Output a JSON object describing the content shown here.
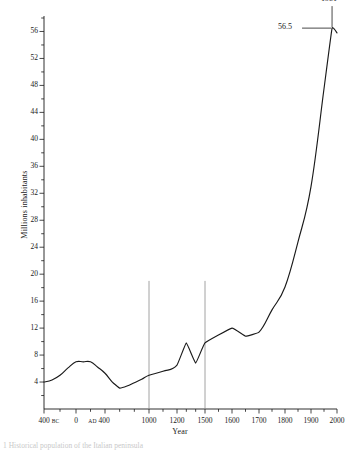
{
  "figure": {
    "caption": "1 Historical population of the Italian peninsula"
  },
  "chart_data": {
    "type": "line",
    "title": "",
    "xlabel": "Year",
    "ylabel": "Millions inhabitants",
    "grid": false,
    "legend": false,
    "ylim": [
      0,
      58
    ],
    "yticks": [
      4,
      8,
      12,
      16,
      20,
      24,
      28,
      32,
      36,
      40,
      44,
      48,
      52,
      56
    ],
    "yminor_step": 2,
    "xtick_labels": [
      "400",
      "0",
      "400",
      "1000",
      "1200",
      "1500",
      "1600",
      "1700",
      "1800",
      "1900",
      "2000"
    ],
    "xtick_eras": [
      "BC",
      "",
      "AD",
      "",
      "",
      "",
      "",
      "",
      "",
      "",
      ""
    ],
    "xticks": [
      -400,
      0,
      400,
      1000,
      1200,
      1500,
      1600,
      1700,
      1800,
      1900,
      2000
    ],
    "x_minor_ticks": [
      -200,
      200,
      600,
      800,
      1100,
      1300,
      1400,
      1550,
      1650,
      1750,
      1850,
      1950
    ],
    "x": [
      -400,
      -300,
      -200,
      -100,
      0,
      100,
      200,
      300,
      400,
      500,
      600,
      700,
      800,
      900,
      1000,
      1100,
      1200,
      1300,
      1400,
      1500,
      1600,
      1650,
      1700,
      1750,
      1800,
      1850,
      1900,
      1950,
      1981,
      2000
    ],
    "y": [
      4.0,
      4.3,
      5.0,
      6.1,
      7.0,
      7.0,
      7.0,
      6.2,
      5.3,
      4.0,
      3.1,
      3.4,
      3.9,
      4.4,
      5.0,
      5.6,
      6.5,
      9.8,
      6.8,
      9.8,
      12.0,
      10.8,
      11.4,
      14.7,
      18.1,
      24.8,
      33.0,
      47.5,
      56.5,
      55.8
    ],
    "series": [
      {
        "name": "Population",
        "color": "#1a1a1a",
        "values": [
          4.0,
          4.3,
          5.0,
          6.1,
          7.0,
          7.0,
          7.0,
          6.2,
          5.3,
          4.0,
          3.1,
          3.4,
          3.9,
          4.4,
          5.0,
          5.6,
          6.5,
          9.8,
          6.8,
          9.8,
          12.0,
          10.8,
          11.4,
          14.7,
          18.1,
          24.8,
          33.0,
          47.5,
          56.5,
          55.8
        ]
      }
    ],
    "reference_lines": [
      {
        "x": 1000,
        "y_top": 19,
        "color": "#8a8a8a"
      },
      {
        "x": 1500,
        "y_top": 19,
        "color": "#8a8a8a"
      }
    ],
    "annotations": [
      {
        "name": "peak-year",
        "text": "1981",
        "x": 1981,
        "y": 56.5
      },
      {
        "name": "peak-value",
        "text": "56.5",
        "x": 1981,
        "y": 56.5
      }
    ]
  }
}
